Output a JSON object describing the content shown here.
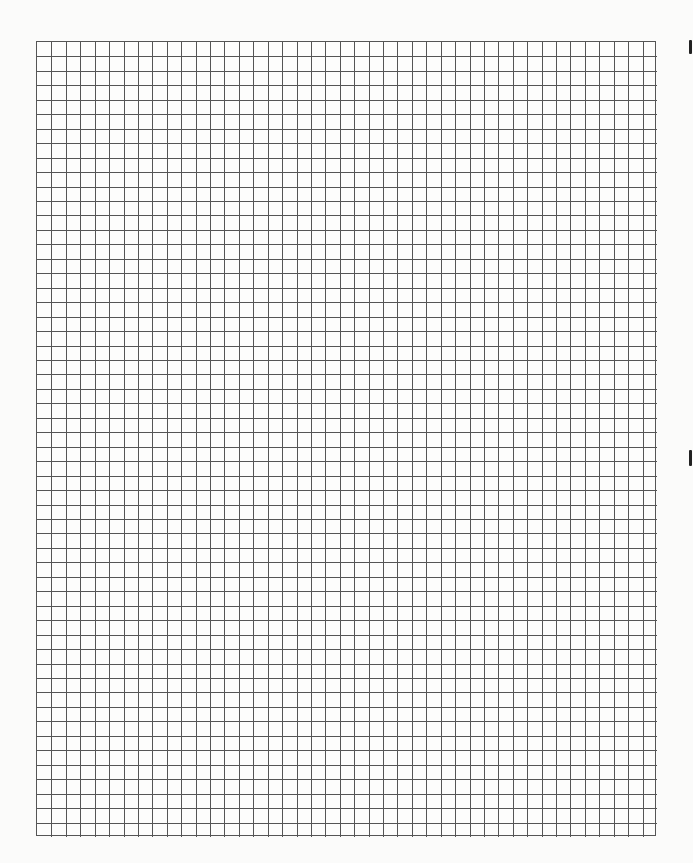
{
  "sheet": {
    "type": "graph-paper",
    "columns": 43,
    "rows": 55,
    "line_color": "#555555",
    "paper_color": "#fbfbfa"
  },
  "edge_marks": [
    {
      "top": 40,
      "height": 14
    },
    {
      "top": 450,
      "height": 16
    }
  ]
}
